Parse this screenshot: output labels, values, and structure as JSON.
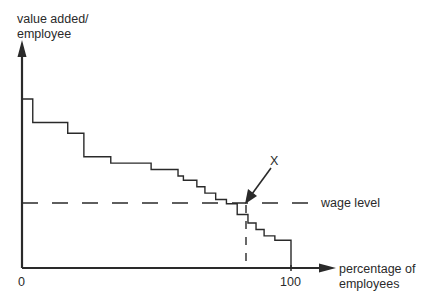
{
  "chart_data": {
    "type": "line",
    "subtype": "step",
    "title": "",
    "xlabel": "percentage of employees",
    "ylabel": "value added/ employee",
    "ylabel_lines": [
      "value added/",
      "employee"
    ],
    "xlabel_lines": [
      "percentage of",
      "employees"
    ],
    "x_ticks": [
      "0",
      "100"
    ],
    "xlim": [
      0,
      100
    ],
    "ylim": [
      0,
      100
    ],
    "y_ticks": [],
    "grid": false,
    "legend": null,
    "values_are_estimated": true,
    "series": [
      {
        "name": "value added per employee (ranked)",
        "x": [
          0,
          4,
          17,
          23,
          33,
          48,
          58,
          60,
          65,
          68,
          72,
          76,
          80,
          84,
          87,
          90,
          94,
          100
        ],
        "values": [
          79,
          68,
          63,
          52,
          49,
          46,
          43,
          41,
          38,
          35,
          32,
          30,
          25,
          21,
          18,
          15,
          13,
          0
        ]
      }
    ],
    "reference_lines": [
      {
        "name": "wage level",
        "orientation": "horizontal",
        "style": "dashed",
        "y": 29
      },
      {
        "name": "X drop line",
        "orientation": "vertical",
        "style": "dashed",
        "x": 82
      }
    ],
    "annotations": [
      {
        "text": "X",
        "x": 82,
        "y": 29,
        "arrow": true
      },
      {
        "text": "wage level",
        "y": 29
      }
    ]
  },
  "labels": {
    "ylabel_line1": "value added/",
    "ylabel_line2": "employee",
    "xlabel_line1": "percentage of",
    "xlabel_line2": "employees",
    "tick_0": "0",
    "tick_100": "100",
    "wage_level": "wage level",
    "point_x": "X"
  },
  "colors": {
    "ink": "#2a2a2a",
    "background": "#ffffff"
  }
}
